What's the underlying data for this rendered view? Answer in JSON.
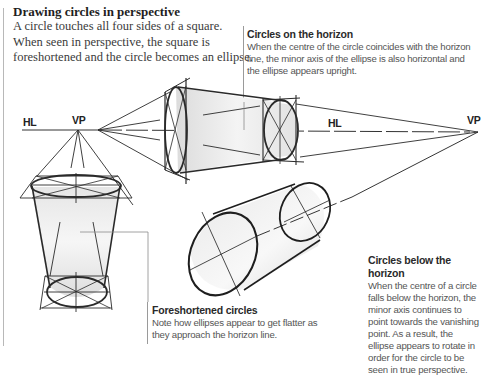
{
  "intro": {
    "title": "Drawing circles in perspective",
    "body": "A circle touches all four sides of a square. When seen in perspective, the square is foreshortened and the circle becomes an ellipse."
  },
  "captions": {
    "horizon": {
      "title": "Circles on the horizon",
      "body": "When the centre of the circle coincides with the horizon line, the minor axis of the ellipse is also horizontal and the ellipse appears upright."
    },
    "below": {
      "title": "Circles below the horizon",
      "body": "When the centre of a circle falls below the horizon, the minor axis continues to point towards the vanishing point. As a result, the ellipse appears to rotate in order for the circle to be seen in true perspective."
    },
    "foreshortened": {
      "title": "Foreshortened circles",
      "body": "Note how ellipses appear to get flatter as they approach the horizon line."
    }
  },
  "labels": {
    "hl_left": "HL",
    "vp_left": "VP",
    "hl_right": "HL",
    "vp_right": "VP"
  },
  "colors": {
    "ink": "#1a1a1a",
    "construction": "#3a3a3a",
    "shade": "#e4e4e4",
    "leader": "#9a9a9a"
  }
}
